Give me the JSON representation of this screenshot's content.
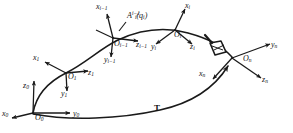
{
  "figure": {
    "type": "robotics-kinematic-chain-diagram",
    "stroke_color": "#1a1a1a",
    "background_color": "#ffffff"
  },
  "frames": [
    {
      "id": "frame-0",
      "origin_label": "O",
      "origin_sub": "0",
      "axes": [
        {
          "name": "x0",
          "label": "x",
          "sub": "0"
        },
        {
          "name": "y0",
          "label": "y",
          "sub": "0"
        },
        {
          "name": "z0",
          "label": "z",
          "sub": "0"
        }
      ]
    },
    {
      "id": "frame-1",
      "origin_label": "O",
      "origin_sub": "1",
      "axes": [
        {
          "name": "x1",
          "label": "x",
          "sub": "1"
        },
        {
          "name": "y1",
          "label": "y",
          "sub": "1"
        },
        {
          "name": "z1",
          "label": "z",
          "sub": "1"
        }
      ]
    },
    {
      "id": "frame-i-minus-1",
      "origin_label": "O",
      "origin_sub": "i−1",
      "axes": [
        {
          "name": "xi-1",
          "label": "x",
          "sub": "i−1"
        },
        {
          "name": "yi-1",
          "label": "y",
          "sub": "i−1"
        },
        {
          "name": "zi-1",
          "label": "z",
          "sub": "i−1"
        }
      ]
    },
    {
      "id": "frame-i",
      "origin_label": "O",
      "origin_sub": "i",
      "axes": [
        {
          "name": "xi",
          "label": "x",
          "sub": "i"
        },
        {
          "name": "yi",
          "label": "y",
          "sub": "i"
        },
        {
          "name": "zi",
          "label": "z",
          "sub": "i"
        }
      ]
    },
    {
      "id": "frame-n",
      "origin_label": "O",
      "origin_sub": "n",
      "axes": [
        {
          "name": "xn",
          "label": "x",
          "sub": "n"
        },
        {
          "name": "yn",
          "label": "y",
          "sub": "n"
        },
        {
          "name": "zn",
          "label": "z",
          "sub": "n"
        }
      ]
    }
  ],
  "labels": {
    "x0": "x",
    "x0_sub": "0",
    "y0": "y",
    "y0_sub": "0",
    "z0": "z",
    "z0_sub": "0",
    "o0": "O",
    "o0_sub": "0",
    "x1": "x",
    "x1_sub": "1",
    "y1": "y",
    "y1_sub": "1",
    "z1": "z",
    "z1_sub": "1",
    "o1": "O",
    "o1_sub": "1",
    "xim1": "x",
    "xim1_sub": "i−1",
    "yim1": "y",
    "yim1_sub": "i−1",
    "zim1": "z",
    "zim1_sub": "i−1",
    "oim1": "O",
    "oim1_sub": "i−1",
    "xi": "x",
    "xi_sub": "i",
    "yi": "y",
    "yi_sub": "i",
    "zi": "z",
    "zi_sub": "i",
    "oi": "O",
    "oi_sub": "i",
    "xn": "x",
    "xn_sub": "n",
    "yn": "y",
    "yn_sub": "n",
    "zn": "z",
    "zn_sub": "n",
    "on": "O",
    "on_sub": "n",
    "transform_A": "A",
    "transform_A_sub": "i",
    "transform_A_sup": "i−1",
    "transform_A_arg": "(q",
    "transform_A_arg_sub": "i",
    "transform_A_arg_close": ")",
    "transform_T": "T"
  }
}
